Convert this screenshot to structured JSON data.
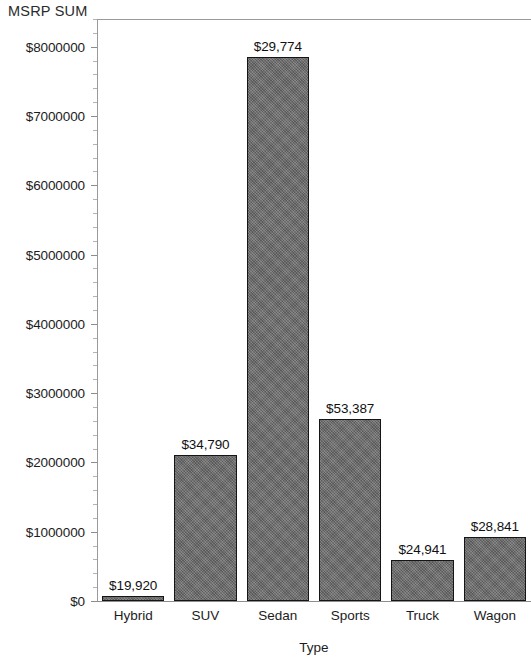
{
  "chart_data": {
    "type": "bar",
    "title": "MSRP SUM",
    "xlabel": "Type",
    "ylabel": "",
    "categories": [
      "Hybrid",
      "SUV",
      "Sedan",
      "Sports",
      "Truck",
      "Wagon"
    ],
    "values": [
      70000,
      2110000,
      7850000,
      2620000,
      590000,
      920000
    ],
    "point_labels": [
      "$19,920",
      "$34,790",
      "$29,774",
      "$53,387",
      "$24,941",
      "$28,841"
    ],
    "ylim": [
      0,
      8400000
    ],
    "y_tick_values": [
      0,
      1000000,
      2000000,
      3000000,
      4000000,
      5000000,
      6000000,
      7000000,
      8000000
    ],
    "y_tick_labels": [
      "$0",
      "$1000000",
      "$2000000",
      "$3000000",
      "$4000000",
      "$5000000",
      "$6000000",
      "$7000000",
      "$8000000"
    ],
    "grid": false,
    "legend": "none",
    "bar_color": "#6e6e6e",
    "bar_border_color": "#151515",
    "axis_color": "#8d8d8d",
    "text_color": "#1c1c1c",
    "background": "#ffffff"
  },
  "title": {
    "text": "MSRP SUM"
  },
  "axes": {
    "x_title": "Type",
    "y_ticks": [
      {
        "label": "$8000000",
        "value": 8000000
      },
      {
        "label": "$7000000",
        "value": 7000000
      },
      {
        "label": "$6000000",
        "value": 6000000
      },
      {
        "label": "$5000000",
        "value": 5000000
      },
      {
        "label": "$4000000",
        "value": 4000000
      },
      {
        "label": "$3000000",
        "value": 3000000
      },
      {
        "label": "$2000000",
        "value": 2000000
      },
      {
        "label": "$1000000",
        "value": 1000000
      },
      {
        "label": "$0",
        "value": 0
      }
    ],
    "x_ticks": [
      {
        "label": "Hybrid"
      },
      {
        "label": "SUV"
      },
      {
        "label": "Sedan"
      },
      {
        "label": "Sports"
      },
      {
        "label": "Truck"
      },
      {
        "label": "Wagon"
      }
    ]
  },
  "bars": [
    {
      "category": "Hybrid",
      "value": 70000,
      "value_label": "$19,920"
    },
    {
      "category": "SUV",
      "value": 2110000,
      "value_label": "$34,790"
    },
    {
      "category": "Sedan",
      "value": 7850000,
      "value_label": "$29,774"
    },
    {
      "category": "Sports",
      "value": 2620000,
      "value_label": "$53,387"
    },
    {
      "category": "Truck",
      "value": 590000,
      "value_label": "$24,941"
    },
    {
      "category": "Wagon",
      "value": 920000,
      "value_label": "$28,841"
    }
  ]
}
